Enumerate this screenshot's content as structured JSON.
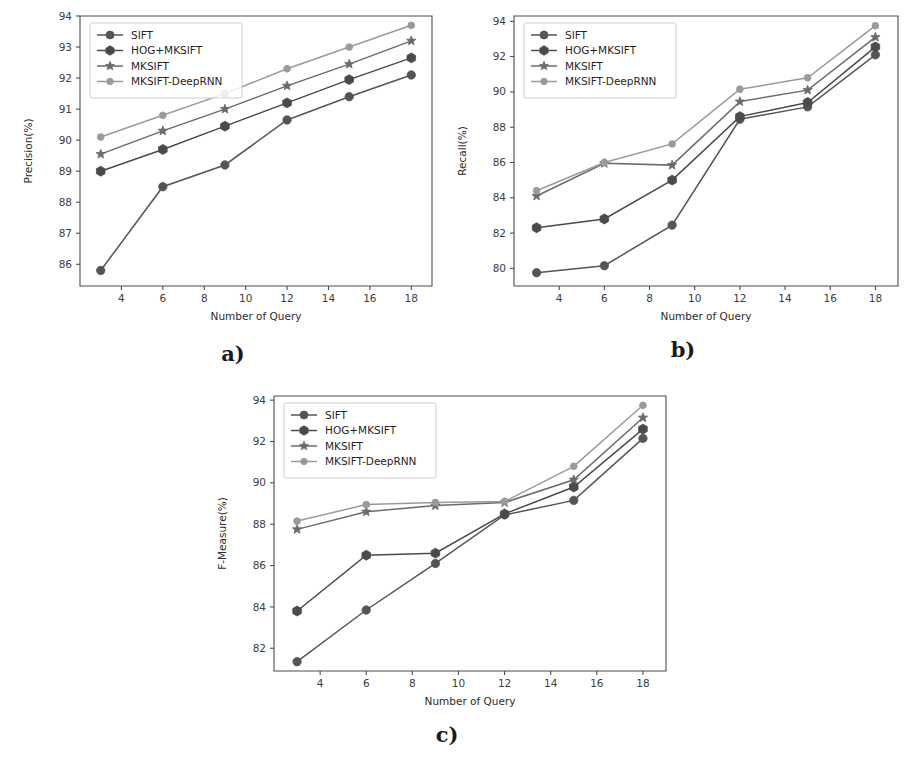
{
  "figure": {
    "panels": [
      {
        "id": "a",
        "caption": "a)",
        "chart_data": {
          "type": "line",
          "title": "",
          "xlabel": "Number of Query",
          "ylabel": "Precision(%)",
          "x": [
            3,
            6,
            9,
            12,
            15,
            18
          ],
          "xlim": [
            2.0,
            19.0
          ],
          "ylim": [
            85.3,
            94.0
          ],
          "xticks": [
            4,
            6,
            8,
            10,
            12,
            14,
            16,
            18
          ],
          "yticks": [
            86,
            87,
            88,
            89,
            90,
            91,
            92,
            93,
            94
          ],
          "grid": false,
          "legend_position": "upper-left",
          "series": [
            {
              "name": "SIFT",
              "marker": "circle",
              "color": "#555555",
              "values": [
                85.8,
                88.5,
                89.2,
                90.65,
                91.4,
                92.1
              ]
            },
            {
              "name": "HOG+MKSIFT",
              "marker": "hexagon",
              "color": "#4a4a4a",
              "values": [
                89.0,
                89.7,
                90.45,
                91.2,
                91.95,
                92.65
              ]
            },
            {
              "name": "MKSIFT",
              "marker": "star",
              "color": "#6b6b6b",
              "values": [
                89.55,
                90.3,
                91.0,
                91.75,
                92.45,
                93.2
              ]
            },
            {
              "name": "MKSIFT-DeepRNN",
              "marker": "circle",
              "color": "#9a9a9a",
              "values": [
                90.1,
                90.8,
                91.5,
                92.3,
                93.0,
                93.7
              ]
            }
          ]
        }
      },
      {
        "id": "b",
        "caption": "b)",
        "chart_data": {
          "type": "line",
          "title": "",
          "xlabel": "Number of Query",
          "ylabel": "Recall(%)",
          "x": [
            3,
            6,
            9,
            12,
            15,
            18
          ],
          "xlim": [
            2.0,
            19.0
          ],
          "ylim": [
            79.0,
            94.3
          ],
          "xticks": [
            4,
            6,
            8,
            10,
            12,
            14,
            16,
            18
          ],
          "yticks": [
            80,
            82,
            84,
            86,
            88,
            90,
            92,
            94
          ],
          "grid": false,
          "legend_position": "upper-left",
          "series": [
            {
              "name": "SIFT",
              "marker": "circle",
              "color": "#555555",
              "values": [
                79.75,
                80.15,
                82.45,
                88.45,
                89.15,
                92.1
              ]
            },
            {
              "name": "HOG+MKSIFT",
              "marker": "hexagon",
              "color": "#4a4a4a",
              "values": [
                82.3,
                82.8,
                85.0,
                88.6,
                89.4,
                92.55
              ]
            },
            {
              "name": "MKSIFT",
              "marker": "star",
              "color": "#6b6b6b",
              "values": [
                84.1,
                85.95,
                85.85,
                89.45,
                90.1,
                93.1
              ]
            },
            {
              "name": "MKSIFT-DeepRNN",
              "marker": "circle",
              "color": "#9a9a9a",
              "values": [
                84.4,
                86.0,
                87.05,
                90.15,
                90.8,
                93.75
              ]
            }
          ]
        }
      },
      {
        "id": "c",
        "caption": "c)",
        "chart_data": {
          "type": "line",
          "title": "",
          "xlabel": "Number of Query",
          "ylabel": "F-Measure(%)",
          "x": [
            3,
            6,
            9,
            12,
            15,
            18
          ],
          "xlim": [
            2.0,
            19.0
          ],
          "ylim": [
            80.9,
            94.2
          ],
          "xticks": [
            4,
            6,
            8,
            10,
            12,
            14,
            16,
            18
          ],
          "yticks": [
            82,
            84,
            86,
            88,
            90,
            92,
            94
          ],
          "grid": false,
          "legend_position": "upper-left",
          "series": [
            {
              "name": "SIFT",
              "marker": "circle",
              "color": "#555555",
              "values": [
                81.35,
                83.85,
                86.1,
                88.45,
                89.15,
                92.15
              ]
            },
            {
              "name": "HOG+MKSIFT",
              "marker": "hexagon",
              "color": "#4a4a4a",
              "values": [
                83.8,
                86.5,
                86.6,
                88.5,
                89.8,
                92.6
              ]
            },
            {
              "name": "MKSIFT",
              "marker": "star",
              "color": "#6b6b6b",
              "values": [
                87.75,
                88.6,
                88.9,
                89.05,
                90.15,
                93.15
              ]
            },
            {
              "name": "MKSIFT-DeepRNN",
              "marker": "circle",
              "color": "#9a9a9a",
              "values": [
                88.15,
                88.95,
                89.05,
                89.1,
                90.8,
                93.75
              ]
            }
          ]
        }
      }
    ]
  }
}
